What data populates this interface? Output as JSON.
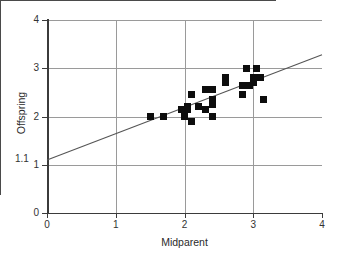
{
  "chart_data": {
    "type": "scatter",
    "title": "",
    "xlabel": "Midparent",
    "ylabel": "Offspring",
    "xlim": [
      0,
      4
    ],
    "ylim": [
      0,
      4
    ],
    "xticks": [
      "0",
      "1",
      "2",
      "3",
      "4"
    ],
    "yticks": [
      "0",
      "1",
      "2",
      "3",
      "4"
    ],
    "grid": true,
    "legend": "none",
    "annotations": [
      {
        "name": "y-intercept-label",
        "text": "1.1",
        "x": 0,
        "y": 1.1
      }
    ],
    "trendline": {
      "type": "line",
      "intercept": 1.1,
      "slope": 0.646,
      "x_start": 0,
      "y_start": 1.1,
      "x_end": 4,
      "y_end": 3.28
    },
    "points": [
      {
        "x": 1.5,
        "y": 2.0
      },
      {
        "x": 1.7,
        "y": 2.0
      },
      {
        "x": 1.95,
        "y": 2.15
      },
      {
        "x": 2.0,
        "y": 2.0
      },
      {
        "x": 2.05,
        "y": 2.15
      },
      {
        "x": 2.05,
        "y": 2.2
      },
      {
        "x": 2.1,
        "y": 2.45
      },
      {
        "x": 2.1,
        "y": 1.9
      },
      {
        "x": 2.2,
        "y": 2.2
      },
      {
        "x": 2.3,
        "y": 2.55
      },
      {
        "x": 2.3,
        "y": 2.15
      },
      {
        "x": 2.4,
        "y": 2.55
      },
      {
        "x": 2.4,
        "y": 2.35
      },
      {
        "x": 2.4,
        "y": 2.25
      },
      {
        "x": 2.4,
        "y": 2.0
      },
      {
        "x": 2.6,
        "y": 2.8
      },
      {
        "x": 2.6,
        "y": 2.7
      },
      {
        "x": 2.85,
        "y": 2.65
      },
      {
        "x": 2.85,
        "y": 2.45
      },
      {
        "x": 2.9,
        "y": 3.0
      },
      {
        "x": 2.95,
        "y": 2.65
      },
      {
        "x": 3.0,
        "y": 2.8
      },
      {
        "x": 3.0,
        "y": 2.7
      },
      {
        "x": 3.05,
        "y": 3.0
      },
      {
        "x": 3.1,
        "y": 2.8
      },
      {
        "x": 3.15,
        "y": 2.35
      }
    ]
  },
  "marker_style": {
    "shape": "square",
    "color": "#0d0d0d",
    "size_px": 7
  },
  "colors": {
    "axis": "#3b3b3b",
    "grid": "#9a9a9a",
    "marker": "#0d0d0d",
    "trendline": "#555555",
    "background": "#ffffff"
  }
}
